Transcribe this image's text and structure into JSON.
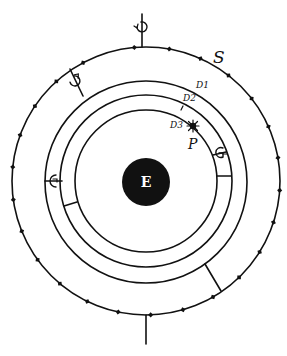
{
  "diagram": {
    "title": "",
    "center": {
      "x": 146,
      "y": 181
    },
    "ink_color": "#111111",
    "background": "#ffffff",
    "rings": [
      {
        "name": "outer-ring",
        "r": 134
      },
      {
        "name": "orbit-ring-1",
        "r": 100
      },
      {
        "name": "orbit-ring-2",
        "r": 86
      },
      {
        "name": "orbit-ring-3",
        "r": 71
      }
    ],
    "earth": {
      "r": 24,
      "label": "E"
    },
    "labels": {
      "sun": "S",
      "planet": "P",
      "ring_1": "D1",
      "ring_2": "D2",
      "ring_3": "D3"
    },
    "outer_tick_angles_deg": [
      -95,
      -80,
      -66,
      -52,
      -38,
      -24,
      -10,
      4,
      18,
      32,
      46,
      60,
      74,
      88,
      102,
      116,
      130,
      144,
      158,
      172,
      186,
      200,
      214,
      228,
      242
    ],
    "symbols": {
      "top": "♉",
      "upper_left": "♉",
      "left": "♉",
      "right": "♉"
    }
  }
}
